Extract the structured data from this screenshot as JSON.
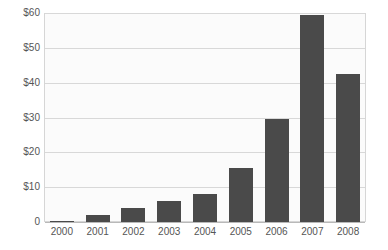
{
  "chart_data": {
    "type": "bar",
    "title": "",
    "subtitle": "",
    "xlabel": "",
    "ylabel": "",
    "categories": [
      "2000",
      "2001",
      "2002",
      "2003",
      "2004",
      "2005",
      "2006",
      "2007",
      "2008"
    ],
    "values": [
      0.3,
      2,
      4,
      6,
      8,
      15.5,
      29.5,
      59.5,
      42.5
    ],
    "ylim": [
      0,
      60
    ],
    "ytick_values": [
      0,
      10,
      20,
      30,
      40,
      50,
      60
    ],
    "ytick_labels": [
      "0",
      "$10",
      "$20",
      "$30",
      "$40",
      "$50",
      "$60"
    ],
    "grid": true,
    "legend": null,
    "legend_position": "none",
    "annotations": [],
    "colors": {
      "bar": "#4a4a4a",
      "gridline": "#d8d8d8",
      "plot_background": "#fbfbfb",
      "plot_border": "#d6d6d6",
      "page_background": "#ffffff",
      "tick_label": "#555555"
    }
  }
}
